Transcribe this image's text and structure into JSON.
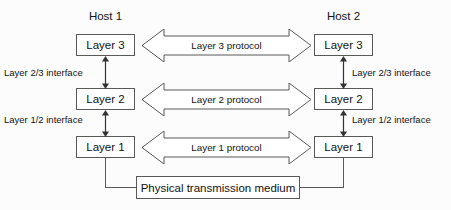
{
  "diagram": {
    "hosts": [
      {
        "id": "host1",
        "label": "Host 1"
      },
      {
        "id": "host2",
        "label": "Host 2"
      }
    ],
    "layers": [
      {
        "id": "layer3",
        "label": "Layer 3"
      },
      {
        "id": "layer2",
        "label": "Layer 2"
      },
      {
        "id": "layer1",
        "label": "Layer 1"
      }
    ],
    "host1_layers": [
      {
        "label": "Layer 3"
      },
      {
        "label": "Layer 2"
      },
      {
        "label": "Layer 1"
      }
    ],
    "host2_layers": [
      {
        "label": "Layer 3"
      },
      {
        "label": "Layer 2"
      },
      {
        "label": "Layer 1"
      }
    ],
    "protocols": [
      {
        "id": "layer3-protocol",
        "label": "Layer 3 protocol"
      },
      {
        "id": "layer2-protocol",
        "label": "Layer 2 protocol"
      },
      {
        "id": "layer1-protocol",
        "label": "Layer 1 protocol"
      }
    ],
    "interfaces_left": [
      {
        "id": "iface-23-left",
        "label": "Layer 2/3 interface"
      },
      {
        "id": "iface-12-left",
        "label": "Layer 1/2 interface"
      }
    ],
    "interfaces_right": [
      {
        "id": "iface-23-right",
        "label": "Layer 2/3 interface"
      },
      {
        "id": "iface-12-right",
        "label": "Layer 1/2 interface"
      }
    ],
    "medium": {
      "id": "physical-medium",
      "label": "Physical transmission medium"
    },
    "colors": {
      "background": "#fcfcfc",
      "stroke": "#595959",
      "box_fill": "#ffffff",
      "text": "#141414"
    }
  }
}
